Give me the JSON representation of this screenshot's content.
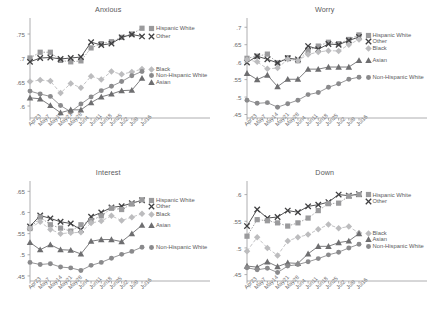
{
  "figure": {
    "background": "#ffffff",
    "panels_layout": "2x2"
  },
  "series_styles": {
    "hispanic_white": {
      "color": "#9a9a9c",
      "marker": "square",
      "dash": "dotted"
    },
    "other": {
      "color": "#3f3f41",
      "marker": "x",
      "dash": "solid"
    },
    "black": {
      "color": "#bcbcbe",
      "marker": "diamond",
      "dash": "dashed"
    },
    "asian": {
      "color": "#6e6e70",
      "marker": "triangle",
      "dash": "solid"
    },
    "non_hispanic_white": {
      "color": "#8a8a8c",
      "marker": "circle",
      "dash": "solid"
    }
  },
  "legend_labels": {
    "hispanic_white": "Hispanic White",
    "other": "Other",
    "black": "Black",
    "asian": "Asian",
    "non_hispanic_white": "Non-Hispanic White"
  },
  "chart_data": [
    {
      "type": "line",
      "title": "Anxious",
      "xlabel": "",
      "ylabel": "",
      "x": [
        "Apr23",
        "May7",
        "May14",
        "May21",
        "May28",
        "Jun4",
        "Jun11",
        "Jun18",
        "Jun25",
        "Jul2",
        "Jul9",
        "Jul16"
      ],
      "ylim": [
        0.575,
        0.775
      ],
      "yticks": [
        ".6",
        ".65",
        ".7",
        ".75"
      ],
      "ytick_values": [
        0.6,
        0.65,
        0.7,
        0.75
      ],
      "grid": false,
      "legend_position": "right",
      "series": [
        {
          "name": "Hispanic White",
          "key": "hispanic_white",
          "values": [
            0.7,
            0.712,
            0.712,
            0.695,
            0.692,
            0.694,
            0.721,
            0.73,
            0.734,
            0.743,
            0.75,
            0.762
          ]
        },
        {
          "name": "Other",
          "key": "other",
          "values": [
            0.692,
            0.7,
            0.701,
            0.698,
            0.7,
            0.702,
            0.733,
            0.727,
            0.73,
            0.743,
            0.749,
            0.745
          ]
        },
        {
          "name": "Black",
          "key": "black",
          "values": [
            0.651,
            0.654,
            0.652,
            0.627,
            0.647,
            0.638,
            0.662,
            0.655,
            0.672,
            0.666,
            0.671,
            0.677
          ]
        },
        {
          "name": "Non-Hispanic White",
          "key": "non_hispanic_white",
          "values": [
            0.631,
            0.625,
            0.62,
            0.601,
            0.588,
            0.604,
            0.619,
            0.632,
            0.641,
            0.651,
            0.663,
            0.672
          ]
        },
        {
          "name": "Asian",
          "key": "asian",
          "values": [
            0.617,
            0.615,
            0.601,
            0.586,
            0.592,
            0.592,
            0.607,
            0.619,
            0.625,
            0.632,
            0.633,
            0.658
          ]
        }
      ],
      "legend": [
        {
          "key": "hispanic_white",
          "label": "Hispanic White"
        },
        {
          "key": "other",
          "label": "Other"
        },
        {
          "key": "black",
          "label": "Black"
        },
        {
          "key": "non_hispanic_white",
          "label": "Non-Hispanic White"
        },
        {
          "key": "asian",
          "label": "Asian"
        }
      ]
    },
    {
      "type": "line",
      "title": "Worry",
      "xlabel": "",
      "ylabel": "",
      "x": [
        "Apr23",
        "May7",
        "May14",
        "May21",
        "May28",
        "Jun4",
        "Jun11",
        "Jun18",
        "Jun25",
        "Jul2",
        "Jul9",
        "Jul16"
      ],
      "ylim": [
        0.44,
        0.715
      ],
      "yticks": [
        ".45",
        ".5",
        ".55",
        ".6",
        ".65",
        ".7"
      ],
      "ytick_values": [
        0.45,
        0.5,
        0.55,
        0.6,
        0.65,
        0.7
      ],
      "grid": false,
      "legend_position": "right",
      "series": [
        {
          "name": "Hispanic White",
          "key": "hispanic_white",
          "values": [
            0.611,
            0.617,
            0.623,
            0.598,
            0.613,
            0.604,
            0.633,
            0.646,
            0.657,
            0.653,
            0.665,
            0.678
          ]
        },
        {
          "name": "Other",
          "key": "other",
          "values": [
            0.599,
            0.617,
            0.608,
            0.598,
            0.611,
            0.608,
            0.646,
            0.637,
            0.652,
            0.65,
            0.662,
            0.672
          ]
        },
        {
          "name": "Black",
          "key": "black",
          "values": [
            0.607,
            0.601,
            0.581,
            0.583,
            0.608,
            0.605,
            0.622,
            0.629,
            0.633,
            0.632,
            0.65,
            0.665
          ]
        },
        {
          "name": "Asian",
          "key": "asian",
          "values": [
            0.568,
            0.55,
            0.563,
            0.53,
            0.551,
            0.551,
            0.58,
            0.58,
            0.586,
            0.586,
            0.586,
            0.605
          ]
        },
        {
          "name": "Non-Hispanic White",
          "key": "non_hispanic_white",
          "values": [
            0.491,
            0.482,
            0.484,
            0.471,
            0.481,
            0.491,
            0.507,
            0.513,
            0.528,
            0.538,
            0.551,
            0.557
          ]
        }
      ],
      "legend": [
        {
          "key": "hispanic_white",
          "label": "Hispanic White"
        },
        {
          "key": "other",
          "label": "Other"
        },
        {
          "key": "black",
          "label": "Black"
        },
        {
          "key": "asian",
          "label": "Asian"
        },
        {
          "key": "non_hispanic_white",
          "label": "Non-Hispanic White"
        }
      ]
    },
    {
      "type": "line",
      "title": "Interest",
      "xlabel": "",
      "ylabel": "",
      "x": [
        "Apr23",
        "May7",
        "May14",
        "May21",
        "May28",
        "Jun4",
        "Jun11",
        "Jun18",
        "Jun25",
        "Jul2",
        "Jul9",
        "Jul16"
      ],
      "ylim": [
        0.438,
        0.665
      ],
      "yticks": [
        ".45",
        ".5",
        ".55",
        ".6",
        ".65"
      ],
      "ytick_values": [
        0.45,
        0.5,
        0.55,
        0.6,
        0.65
      ],
      "grid": false,
      "legend_position": "right",
      "series": [
        {
          "name": "Other",
          "key": "other",
          "values": [
            0.567,
            0.593,
            0.586,
            0.578,
            0.574,
            0.559,
            0.59,
            0.6,
            0.612,
            0.615,
            0.622,
            0.629
          ]
        },
        {
          "name": "Hispanic White",
          "key": "hispanic_white",
          "values": [
            0.562,
            0.589,
            0.571,
            0.563,
            0.556,
            0.571,
            0.581,
            0.592,
            0.61,
            0.607,
            0.62,
            0.63
          ]
        },
        {
          "name": "Black",
          "key": "black",
          "values": [
            0.563,
            0.578,
            0.56,
            0.55,
            0.552,
            0.553,
            0.575,
            0.58,
            0.592,
            0.581,
            0.589,
            0.597
          ]
        },
        {
          "name": "Asian",
          "key": "asian",
          "values": [
            0.529,
            0.512,
            0.524,
            0.512,
            0.511,
            0.502,
            0.532,
            0.536,
            0.536,
            0.531,
            0.55,
            0.57
          ]
        },
        {
          "name": "Non-Hispanic White",
          "key": "non_hispanic_white",
          "values": [
            0.482,
            0.477,
            0.479,
            0.471,
            0.469,
            0.463,
            0.475,
            0.482,
            0.492,
            0.501,
            0.508,
            0.518
          ]
        }
      ],
      "legend": [
        {
          "key": "hispanic_white",
          "label": "Hispanic White"
        },
        {
          "key": "other",
          "label": "Other"
        },
        {
          "key": "black",
          "label": "Black"
        },
        {
          "key": "asian",
          "label": "Asian"
        },
        {
          "key": "non_hispanic_white",
          "label": "Non-Hispanic White"
        }
      ]
    },
    {
      "type": "line",
      "title": "Down",
      "xlabel": "",
      "ylabel": "",
      "x": [
        "Apr23",
        "May7",
        "May14",
        "May21",
        "May28",
        "Jun4",
        "Jun11",
        "Jun18",
        "Jun25",
        "Jul2",
        "Jul9",
        "Jul16"
      ],
      "ylim": [
        0.438,
        0.618
      ],
      "yticks": [
        ".45",
        ".5",
        ".55",
        ".6"
      ],
      "ytick_values": [
        0.45,
        0.5,
        0.55,
        0.6
      ],
      "grid": false,
      "legend_position": "right",
      "series": [
        {
          "name": "Other",
          "key": "other",
          "values": [
            0.541,
            0.572,
            0.556,
            0.558,
            0.57,
            0.567,
            0.578,
            0.581,
            0.586,
            0.6,
            0.598,
            0.601
          ]
        },
        {
          "name": "Hispanic White",
          "key": "hispanic_white",
          "values": [
            0.522,
            0.553,
            0.551,
            0.547,
            0.541,
            0.547,
            0.556,
            0.57,
            0.583,
            0.584,
            0.597,
            0.6
          ]
        },
        {
          "name": "Black",
          "key": "black",
          "values": [
            0.494,
            0.52,
            0.5,
            0.486,
            0.513,
            0.52,
            0.525,
            0.535,
            0.544,
            0.537,
            0.54,
            0.528
          ]
        },
        {
          "name": "Asian",
          "key": "asian",
          "values": [
            0.466,
            0.464,
            0.474,
            0.465,
            0.472,
            0.471,
            0.489,
            0.503,
            0.503,
            0.51,
            0.513,
            0.527
          ]
        },
        {
          "name": "Non-Hispanic White",
          "key": "non_hispanic_white",
          "values": [
            0.463,
            0.459,
            0.462,
            0.454,
            0.466,
            0.469,
            0.474,
            0.48,
            0.487,
            0.492,
            0.5,
            0.507
          ]
        }
      ],
      "legend": [
        {
          "key": "hispanic_white",
          "label": "Hispanic White"
        },
        {
          "key": "other",
          "label": "Other"
        },
        {
          "key": "black",
          "label": "Black"
        },
        {
          "key": "asian",
          "label": "Asian"
        },
        {
          "key": "non_hispanic_white",
          "label": "Non-Hispanic White"
        }
      ]
    }
  ]
}
